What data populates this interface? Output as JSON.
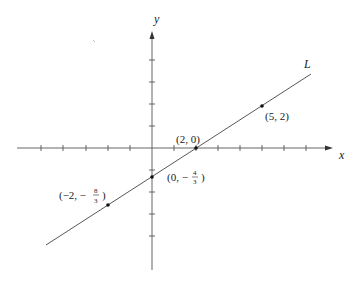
{
  "diagram": {
    "type": "coordinate-plane-line",
    "axes": {
      "x_label": "x",
      "y_label": "y"
    },
    "line": {
      "label": "L",
      "equation": "y = (2/3)x - 4/3"
    },
    "points": [
      {
        "label": "(2, 0)",
        "x": 2,
        "y": 0
      },
      {
        "label": "(5, 2)",
        "x": 5,
        "y": 2
      },
      {
        "label": "(0, -4/3)",
        "x": 0,
        "y": -1.3333
      },
      {
        "label": "(-2, -8/3)",
        "x": -2,
        "y": -2.6667
      }
    ],
    "text": {
      "p20": "(2, 0)",
      "p52": "(5, 2)",
      "p0_pre": "(0, −",
      "p0_num": "4",
      "p0_den": "3",
      "p0_post": ")",
      "pm2_pre": "(−2, −",
      "pm2_num": "8",
      "pm2_den": "3",
      "pm2_post": ")"
    }
  }
}
